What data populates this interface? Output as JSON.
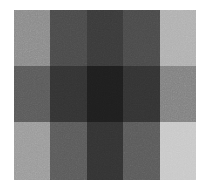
{
  "figure": {
    "kind": "grayscale-patch-test-pattern",
    "background_color": "#ffffff",
    "canvas": {
      "width": 209,
      "height": 190
    },
    "plot_area": {
      "x": 14,
      "y": 10,
      "width": 182,
      "height": 170
    },
    "texture": {
      "description": "uniform fine-grain sensor noise over all patches",
      "amplitude": 0.06
    }
  },
  "chart_data": {
    "type": "heatmap",
    "title": "",
    "subtitle": "",
    "xlabel": "",
    "ylabel": "",
    "grid": false,
    "legend": "none",
    "colormap": "grayscale",
    "rows": 3,
    "cols": 5,
    "row_labels": [
      "row-1",
      "row-2",
      "row-3"
    ],
    "col_labels": [
      "col-1",
      "col-2",
      "col-3",
      "col-4",
      "col-5"
    ],
    "value_unit": "8-bit luminance",
    "vmin": 0,
    "vmax": 255,
    "row_boundaries_px": [
      10,
      66,
      122,
      180
    ],
    "col_boundaries_px": [
      14,
      50,
      87,
      123,
      160,
      196
    ],
    "values": [
      [
        138,
        74,
        58,
        74,
        176
      ],
      [
        90,
        51,
        30,
        51,
        128
      ],
      [
        154,
        90,
        51,
        90,
        200
      ]
    ],
    "hex": [
      [
        "#8a8a8a",
        "#4a4a4a",
        "#3a3a3a",
        "#4a4a4a",
        "#b0b0b0"
      ],
      [
        "#5a5a5a",
        "#333333",
        "#1e1e1e",
        "#333333",
        "#808080"
      ],
      [
        "#9a9a9a",
        "#5a5a5a",
        "#333333",
        "#5a5a5a",
        "#c8c8c8"
      ]
    ],
    "row_mean_luminance": [
      104,
      70,
      117
    ],
    "col_mean_luminance": [
      127,
      72,
      46,
      72,
      168
    ],
    "darkest_cell": {
      "row": 1,
      "col": 2,
      "value": 30,
      "hex": "#1e1e1e"
    },
    "lightest_cell": {
      "row": 2,
      "col": 4,
      "value": 200,
      "hex": "#c8c8c8"
    }
  }
}
